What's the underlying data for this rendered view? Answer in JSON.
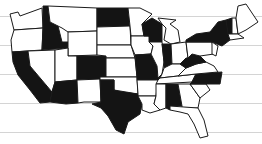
{
  "map": {
    "title": "United States map with highlighted states",
    "fill_color": "#141414",
    "empty_color": "#ffffff",
    "rule_color": "#d4d4d4",
    "rule_lines_y": [
      16,
      45,
      74,
      103,
      132
    ],
    "highlighted_states": [
      "California",
      "Idaho",
      "North Dakota",
      "Colorado",
      "Texas",
      "Missouri",
      "Wisconsin",
      "Indiana",
      "New York",
      "Vermont",
      "West Virginia",
      "North Carolina",
      "Alabama",
      "Arizona"
    ],
    "unhighlighted_states": [
      "Washington",
      "Oregon",
      "Nevada",
      "Utah",
      "Montana",
      "Wyoming",
      "New Mexico",
      "South Dakota",
      "Nebraska",
      "Kansas",
      "Oklahoma",
      "Minnesota",
      "Iowa",
      "Arkansas",
      "Louisiana",
      "Illinois",
      "Michigan",
      "Ohio",
      "Kentucky",
      "Tennessee",
      "Mississippi",
      "Georgia",
      "Florida",
      "South Carolina",
      "Virginia",
      "Pennsylvania",
      "Maine",
      "New Hampshire",
      "Massachusetts",
      "New Jersey"
    ]
  }
}
